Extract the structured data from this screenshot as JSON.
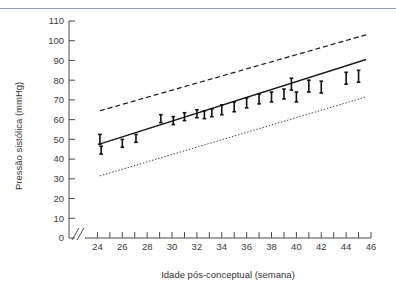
{
  "figure": {
    "background_color": "#ffffff",
    "rule_color": "#8f9aa6",
    "ink_color": "#1a1a1a"
  },
  "chart_data": {
    "type": "scatter",
    "title": "",
    "subtitle": "",
    "xlabel": "Idade pós-conceptual (semana)",
    "ylabel": "Pressão sistólica (mmHg)",
    "xlim": [
      23,
      46
    ],
    "ylim": [
      0,
      110
    ],
    "grid": false,
    "legend_position": "none",
    "axis_break_y": true,
    "axis_break_x": true,
    "x_ticks": [
      24,
      25,
      26,
      27,
      28,
      29,
      30,
      31,
      32,
      33,
      34,
      35,
      36,
      37,
      38,
      39,
      40,
      41,
      42,
      43,
      44,
      45,
      46
    ],
    "x_tick_labels": [
      "24",
      "",
      "26",
      "",
      "28",
      "",
      "30",
      "",
      "32",
      "",
      "34",
      "",
      "36",
      "",
      "38",
      "",
      "40",
      "",
      "42",
      "",
      "44",
      "",
      "46"
    ],
    "y_ticks": [
      0,
      10,
      20,
      30,
      40,
      50,
      60,
      70,
      80,
      90,
      100,
      110
    ],
    "y_tick_labels": [
      "0",
      "10",
      "20",
      "30",
      "40",
      "50",
      "60",
      "70",
      "80",
      "90",
      "100",
      "110"
    ],
    "series": [
      {
        "name": "Limite superior",
        "style": "dashed",
        "type": "line",
        "x": [
          24.2,
          45.6
        ],
        "values": [
          64.5,
          103.0
        ]
      },
      {
        "name": "Média (regressão)",
        "style": "solid",
        "type": "line",
        "x": [
          24.1,
          45.6
        ],
        "values": [
          47.5,
          90.5
        ]
      },
      {
        "name": "Limite inferior",
        "style": "dotted",
        "type": "line",
        "x": [
          24.2,
          45.6
        ],
        "values": [
          31.5,
          71.5
        ]
      },
      {
        "name": "Pressão sistólica observada",
        "style": "errorbar",
        "type": "scatter",
        "x": [
          24.2,
          24.3,
          26.0,
          27.1,
          29.1,
          30.1,
          31.0,
          32.0,
          32.6,
          33.2,
          34.0,
          35.0,
          36.0,
          37.0,
          38.0,
          39.0,
          39.6,
          40.0,
          41.0,
          42.0,
          44.0,
          45.0
        ],
        "values": [
          50.0,
          44.5,
          48.0,
          50.5,
          60.5,
          59.5,
          61.5,
          63.0,
          62.5,
          63.5,
          65.0,
          66.5,
          68.5,
          70.5,
          71.5,
          73.0,
          78.0,
          71.5,
          77.0,
          76.5,
          81.0,
          82.0
        ],
        "err_low": [
          2.5,
          2.0,
          2.0,
          2.0,
          2.0,
          2.0,
          2.0,
          2.0,
          2.0,
          2.0,
          2.5,
          2.5,
          2.5,
          2.5,
          2.5,
          2.5,
          3.0,
          2.5,
          3.0,
          3.0,
          3.0,
          3.0
        ],
        "err_high": [
          2.5,
          2.0,
          2.0,
          2.0,
          2.0,
          2.0,
          2.0,
          2.0,
          2.0,
          2.0,
          2.5,
          2.5,
          2.5,
          2.5,
          2.5,
          2.5,
          3.0,
          2.5,
          3.0,
          3.0,
          3.0,
          3.0
        ]
      }
    ]
  }
}
